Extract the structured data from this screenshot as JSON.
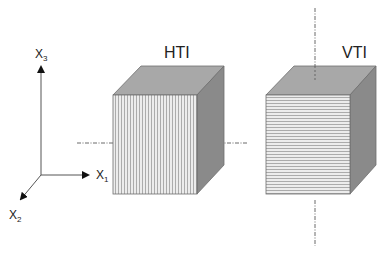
{
  "diagram": {
    "cubes": [
      {
        "id": "hti",
        "label": "HTI",
        "face_pattern": "vertical-lines",
        "symmetry_axis": "horizontal"
      },
      {
        "id": "vti",
        "label": "VTI",
        "face_pattern": "horizontal-lines",
        "symmetry_axis": "vertical"
      }
    ],
    "axes": {
      "x1": {
        "base": "X",
        "sub": "1"
      },
      "x2": {
        "base": "X",
        "sub": "2"
      },
      "x3": {
        "base": "X",
        "sub": "3"
      }
    },
    "colors": {
      "top_face": "#a6a6a6",
      "side_face": "#8a8a8a",
      "front_face": "#e6e6e6",
      "stripe": "#9a9a9a",
      "edge": "#6e6e6e",
      "axis_line": "#555555"
    }
  }
}
